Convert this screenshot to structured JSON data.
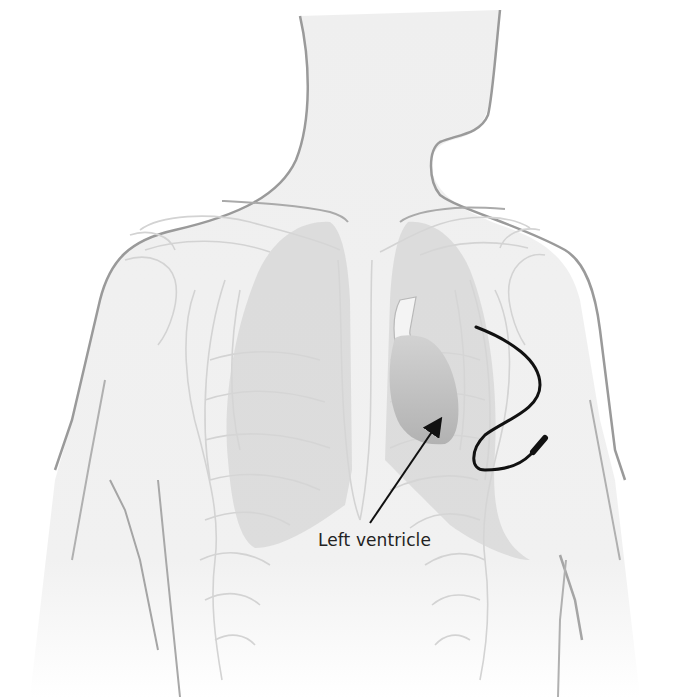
{
  "diagram": {
    "labels": [
      {
        "id": "left-ventricle",
        "text": "Left ventricle"
      }
    ],
    "colors": {
      "body_outline": "#9a9a9a",
      "body_fill": "#efefef",
      "ribs": "#d0d0d0",
      "lungs": "#d6d6d6",
      "heart": "#bdbdbd",
      "lead": "#111111",
      "arrow": "#111111",
      "text": "#222222"
    }
  }
}
